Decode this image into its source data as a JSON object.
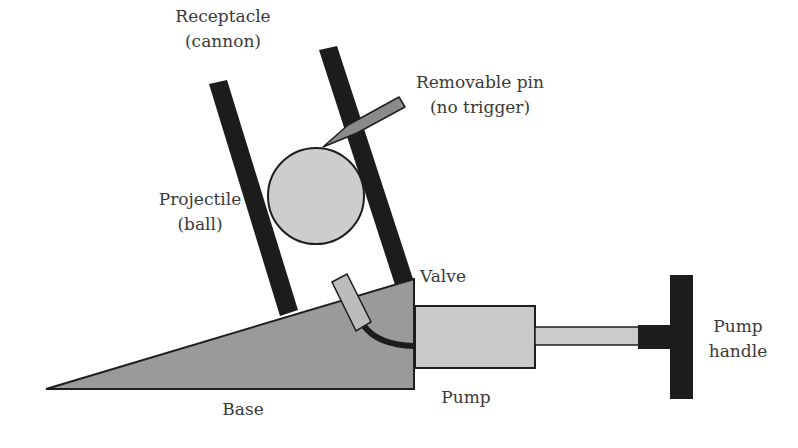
{
  "diagram": {
    "type": "schematic",
    "colors": {
      "background": "#ffffff",
      "outline": "#1e1e1e",
      "rod": "#1c1c1c",
      "base_fill": "#9a9a9a",
      "ball_fill": "#cdcdcd",
      "pump_fill": "#c9c9c9",
      "pin_fill": "#8a8a8a",
      "valve_fill": "#bcbcbc",
      "handle_fill": "#1c1c1c",
      "label_text": "#3a3a3a"
    },
    "labels": {
      "receptacle": {
        "line1": "Receptacle",
        "line2": "(cannon)"
      },
      "pin": {
        "line1": "Removable pin",
        "line2": "(no trigger)"
      },
      "projectile": {
        "line1": "Projectile",
        "line2": "(ball)"
      },
      "valve": {
        "line1": "Valve"
      },
      "pump_handle": {
        "line1": "Pump",
        "line2": "handle"
      },
      "pump": {
        "line1": "Pump"
      },
      "base": {
        "line1": "Base"
      }
    }
  }
}
